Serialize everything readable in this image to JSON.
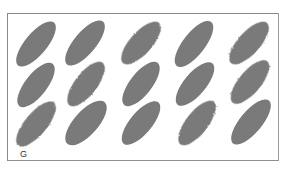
{
  "figure": {
    "label": "G",
    "grid": {
      "columns": 5,
      "rows": 3
    },
    "ellipse_color": "#7a7a7a",
    "frame_color": "#8a8a8a",
    "ellipses": [
      {
        "cx": 36,
        "cy": 44,
        "rx": 28,
        "ry": 11,
        "angle": -50,
        "fuzzy": false
      },
      {
        "cx": 36,
        "cy": 85,
        "rx": 27,
        "ry": 11,
        "angle": -52,
        "fuzzy": false
      },
      {
        "cx": 36,
        "cy": 124,
        "rx": 28,
        "ry": 11,
        "angle": -50,
        "fuzzy": true
      },
      {
        "cx": 85,
        "cy": 43,
        "rx": 28,
        "ry": 11,
        "angle": -50,
        "fuzzy": false
      },
      {
        "cx": 86,
        "cy": 84,
        "rx": 27,
        "ry": 11,
        "angle": -52,
        "fuzzy": true
      },
      {
        "cx": 86,
        "cy": 123,
        "rx": 28,
        "ry": 12,
        "angle": -48,
        "fuzzy": false
      },
      {
        "cx": 141,
        "cy": 43,
        "rx": 27,
        "ry": 11,
        "angle": -48,
        "fuzzy": true
      },
      {
        "cx": 141,
        "cy": 84,
        "rx": 27,
        "ry": 11,
        "angle": -52,
        "fuzzy": false
      },
      {
        "cx": 141,
        "cy": 123,
        "rx": 27,
        "ry": 11,
        "angle": -50,
        "fuzzy": false
      },
      {
        "cx": 194,
        "cy": 44,
        "rx": 28,
        "ry": 11,
        "angle": -52,
        "fuzzy": false
      },
      {
        "cx": 195,
        "cy": 84,
        "rx": 27,
        "ry": 11,
        "angle": -50,
        "fuzzy": false
      },
      {
        "cx": 197,
        "cy": 123,
        "rx": 27,
        "ry": 11,
        "angle": -52,
        "fuzzy": true
      },
      {
        "cx": 249,
        "cy": 43,
        "rx": 27,
        "ry": 11,
        "angle": -48,
        "fuzzy": true
      },
      {
        "cx": 250,
        "cy": 82,
        "rx": 27,
        "ry": 11,
        "angle": -50,
        "fuzzy": true
      },
      {
        "cx": 251,
        "cy": 122,
        "rx": 28,
        "ry": 11,
        "angle": -50,
        "fuzzy": false
      }
    ]
  }
}
